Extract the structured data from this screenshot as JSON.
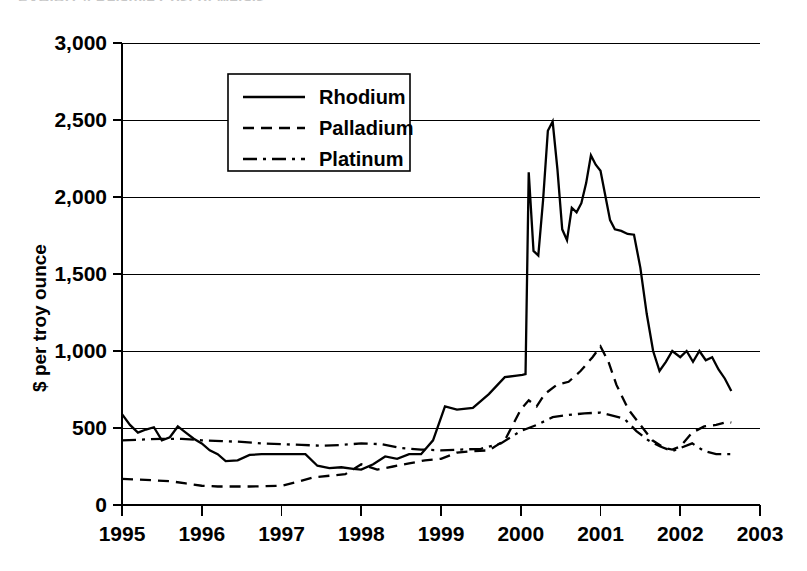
{
  "title": "EXHIBIT 4   Relative Cost of Metals",
  "axes": {
    "ylabel": "$ per troy ounce",
    "xlabel": "",
    "y_ticks": [
      "0",
      "500",
      "1,000",
      "1,500",
      "2,000",
      "2,500",
      "3,000"
    ],
    "x_ticks": [
      "1995",
      "1996",
      "1997",
      "1998",
      "1999",
      "2000",
      "2001",
      "2002",
      "2003"
    ]
  },
  "legend": {
    "position": "top-left-inside",
    "entries": [
      {
        "label": "Rhodium",
        "dash": "solid",
        "swatch": "rhodium-swatch"
      },
      {
        "label": "Palladium",
        "dash": "dashed",
        "swatch": "palladium-swatch"
      },
      {
        "label": "Platinum",
        "dash": "dash-dot",
        "swatch": "platinum-swatch"
      }
    ]
  },
  "chart_data": {
    "type": "line",
    "title": "EXHIBIT 4   Relative Cost of Metals",
    "xlabel": "",
    "ylabel": "$ per troy ounce",
    "xlim": [
      1995,
      2003
    ],
    "ylim": [
      0,
      3000
    ],
    "ytick_step": 500,
    "grid": true,
    "x_unit": "year (decimal, quarterly/monthly samples)",
    "series": [
      {
        "name": "Rhodium",
        "style": "solid",
        "color": "#000000",
        "x": [
          1995.0,
          1995.1,
          1995.2,
          1995.3,
          1995.4,
          1995.5,
          1995.6,
          1995.7,
          1995.8,
          1995.9,
          1996.0,
          1996.1,
          1996.2,
          1996.3,
          1996.45,
          1996.6,
          1996.75,
          1996.9,
          1997.0,
          1997.15,
          1997.3,
          1997.45,
          1997.6,
          1997.75,
          1997.9,
          1998.0,
          1998.15,
          1998.3,
          1998.45,
          1998.6,
          1998.75,
          1998.9,
          1999.05,
          1999.2,
          1999.4,
          1999.6,
          1999.8,
          1999.95,
          2000.02,
          2000.06,
          2000.1,
          2000.16,
          2000.22,
          2000.28,
          2000.34,
          2000.4,
          2000.46,
          2000.52,
          2000.58,
          2000.64,
          2000.7,
          2000.76,
          2000.82,
          2000.88,
          2000.94,
          2001.0,
          2001.06,
          2001.12,
          2001.18,
          2001.26,
          2001.34,
          2001.42,
          2001.5,
          2001.58,
          2001.66,
          2001.74,
          2001.82,
          2001.9,
          2002.0,
          2002.08,
          2002.16,
          2002.24,
          2002.32,
          2002.4,
          2002.48,
          2002.56,
          2002.64
        ],
        "y": [
          590,
          520,
          470,
          490,
          505,
          420,
          440,
          510,
          470,
          430,
          400,
          355,
          330,
          285,
          290,
          325,
          330,
          330,
          330,
          330,
          330,
          255,
          240,
          245,
          235,
          230,
          265,
          315,
          300,
          330,
          330,
          420,
          640,
          620,
          630,
          720,
          830,
          840,
          845,
          850,
          2160,
          1650,
          1620,
          1980,
          2430,
          2490,
          2180,
          1790,
          1720,
          1930,
          1900,
          1960,
          2090,
          2270,
          2210,
          2170,
          2010,
          1850,
          1790,
          1780,
          1760,
          1755,
          1540,
          1240,
          1000,
          870,
          930,
          1000,
          960,
          1000,
          930,
          1000,
          940,
          960,
          880,
          820,
          740
        ]
      },
      {
        "name": "Palladium",
        "style": "dashed",
        "color": "#000000",
        "x": [
          1995.0,
          1995.2,
          1995.4,
          1995.6,
          1995.8,
          1996.0,
          1996.2,
          1996.4,
          1996.6,
          1996.8,
          1997.0,
          1997.2,
          1997.4,
          1997.6,
          1997.8,
          1998.0,
          1998.2,
          1998.4,
          1998.6,
          1998.8,
          1999.0,
          1999.2,
          1999.4,
          1999.6,
          1999.8,
          2000.0,
          2000.1,
          2000.2,
          2000.3,
          2000.45,
          2000.6,
          2000.75,
          2000.9,
          2001.0,
          2001.1,
          2001.2,
          2001.35,
          2001.5,
          2001.65,
          2001.8,
          2001.9,
          2002.0,
          2002.15,
          2002.3,
          2002.45,
          2002.6,
          2002.64
        ],
        "y": [
          170,
          165,
          160,
          155,
          140,
          125,
          120,
          120,
          120,
          122,
          125,
          150,
          180,
          190,
          200,
          265,
          230,
          250,
          270,
          290,
          300,
          340,
          350,
          355,
          420,
          620,
          680,
          640,
          720,
          780,
          800,
          870,
          960,
          1030,
          930,
          780,
          620,
          520,
          420,
          370,
          360,
          380,
          470,
          510,
          520,
          540,
          535
        ]
      },
      {
        "name": "Platinum",
        "style": "dash-dot",
        "color": "#000000",
        "x": [
          1995.0,
          1995.25,
          1995.5,
          1995.75,
          1996.0,
          1996.25,
          1996.5,
          1996.75,
          1997.0,
          1997.25,
          1997.5,
          1997.75,
          1998.0,
          1998.25,
          1998.5,
          1998.75,
          1999.0,
          1999.25,
          1999.5,
          1999.75,
          2000.0,
          2000.2,
          2000.4,
          2000.6,
          2000.8,
          2001.0,
          2001.15,
          2001.3,
          2001.45,
          2001.6,
          2001.75,
          2001.9,
          2002.0,
          2002.15,
          2002.3,
          2002.45,
          2002.6,
          2002.64
        ],
        "y": [
          420,
          425,
          430,
          430,
          420,
          415,
          410,
          400,
          395,
          390,
          385,
          390,
          400,
          395,
          370,
          360,
          355,
          360,
          365,
          400,
          480,
          520,
          570,
          585,
          595,
          600,
          580,
          560,
          480,
          420,
          380,
          350,
          370,
          400,
          350,
          330,
          330,
          330
        ]
      }
    ]
  }
}
